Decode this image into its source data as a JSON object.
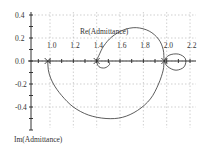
{
  "chart_data": {
    "type": "line",
    "title": "",
    "xlabel": "Re(Admittance)",
    "ylabel": "Im(Admittance)",
    "xlim": [
      0.85,
      2.25
    ],
    "ylim": [
      -0.6,
      0.42
    ],
    "x_ticks": [
      "1.0",
      "1.2",
      "1.4",
      "1.6",
      "1.8",
      "2.0",
      "2.2"
    ],
    "y_ticks": [
      "0.4",
      "0.2",
      "0.0",
      "-0.2",
      "-0.4"
    ],
    "grid": true,
    "legend": "none",
    "markers": [
      {
        "x": 0.98,
        "y": 0.0,
        "symbol": "x"
      },
      {
        "x": 1.4,
        "y": 0.0,
        "symbol": "x"
      },
      {
        "x": 1.98,
        "y": 0.0,
        "symbol": "x"
      }
    ],
    "series": [
      {
        "name": "admittance locus",
        "points": [
          [
            0.98,
            0.0
          ],
          [
            0.99,
            -0.1
          ],
          [
            1.03,
            -0.2
          ],
          [
            1.1,
            -0.3
          ],
          [
            1.2,
            -0.4
          ],
          [
            1.33,
            -0.47
          ],
          [
            1.48,
            -0.5
          ],
          [
            1.62,
            -0.49
          ],
          [
            1.75,
            -0.43
          ],
          [
            1.86,
            -0.33
          ],
          [
            1.93,
            -0.2
          ],
          [
            1.97,
            -0.08
          ],
          [
            1.98,
            0.0
          ],
          [
            2.02,
            0.05
          ],
          [
            2.1,
            0.06
          ],
          [
            2.16,
            0.02
          ],
          [
            2.15,
            -0.05
          ],
          [
            2.08,
            -0.08
          ],
          [
            2.01,
            -0.05
          ],
          [
            1.98,
            0.0
          ],
          [
            1.97,
            0.1
          ],
          [
            1.93,
            0.19
          ],
          [
            1.85,
            0.26
          ],
          [
            1.74,
            0.29
          ],
          [
            1.63,
            0.27
          ],
          [
            1.53,
            0.21
          ],
          [
            1.46,
            0.13
          ],
          [
            1.42,
            0.05
          ],
          [
            1.4,
            0.0
          ],
          [
            1.42,
            -0.05
          ],
          [
            1.47,
            -0.06
          ],
          [
            1.51,
            -0.03
          ],
          [
            1.5,
            0.0
          ]
        ]
      }
    ]
  }
}
